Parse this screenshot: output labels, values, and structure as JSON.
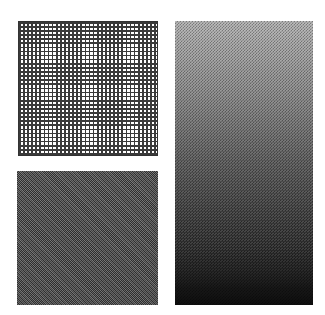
{
  "figure": {
    "panels": [
      {
        "id": "grid-panel",
        "pattern": "square-grid-mesh",
        "line_color": "#3a3a3a",
        "background": "#ffffff"
      },
      {
        "id": "checker-panel",
        "pattern": "fine-checkerboard-dither",
        "tone": "#5a5a5a"
      },
      {
        "id": "gradient-panel",
        "pattern": "dithered-vertical-gradient",
        "top_color": "#b8b8b8",
        "bottom_color": "#0e0e0e"
      }
    ]
  }
}
